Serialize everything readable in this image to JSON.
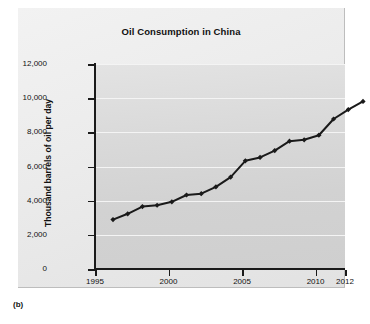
{
  "figure": {
    "caption": "(b)"
  },
  "chart_data": {
    "type": "line",
    "title": "Oil Consumption in China",
    "xlabel": "",
    "ylabel": "Thousand barrels of oil per day",
    "xlim": [
      1995,
      2012
    ],
    "ylim": [
      0,
      12000
    ],
    "grid": true,
    "legend": "none",
    "marker": "diamond",
    "line_color": "#1a1a1a",
    "plot_background": "#d8d8d8",
    "gridline_color": "#f4f4f4",
    "x": [
      1995,
      1996,
      1997,
      1998,
      1999,
      2000,
      2001,
      2002,
      2003,
      2004,
      2005,
      2006,
      2007,
      2008,
      2009,
      2010,
      2011,
      2012
    ],
    "values": [
      3360,
      3700,
      4120,
      4200,
      4400,
      4800,
      4880,
      5280,
      5850,
      6800,
      7000,
      7400,
      7950,
      8030,
      8300,
      9250,
      9800,
      10280
    ],
    "xticks": [
      {
        "value": 1995,
        "label": "1995"
      },
      {
        "value": 2000,
        "label": "2000"
      },
      {
        "value": 2005,
        "label": "2005"
      },
      {
        "value": 2010,
        "label": "2010"
      },
      {
        "value": 2012,
        "label": "2012"
      }
    ],
    "yticks": [
      {
        "value": 0,
        "label": "0"
      },
      {
        "value": 2000,
        "label": "2,000"
      },
      {
        "value": 4000,
        "label": "4,000"
      },
      {
        "value": 6000,
        "label": "6,000"
      },
      {
        "value": 8000,
        "label": "8,000"
      },
      {
        "value": 10000,
        "label": "10,000"
      },
      {
        "value": 12000,
        "label": "12,000"
      }
    ]
  }
}
